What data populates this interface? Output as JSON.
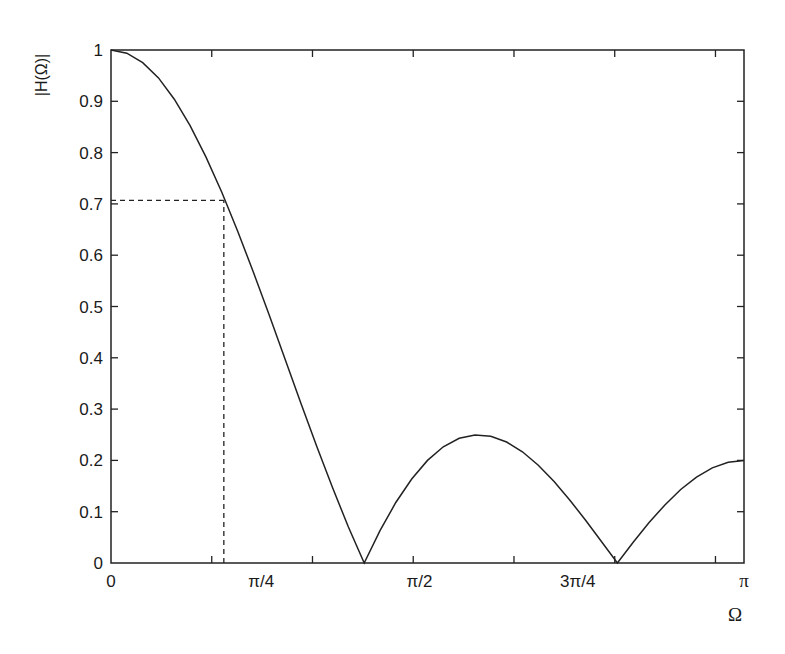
{
  "chart_data": {
    "type": "line",
    "title": "",
    "xlabel": "Ω",
    "ylabel": "|H(Ω)|",
    "xlim": [
      0,
      3.14159
    ],
    "ylim": [
      0,
      1
    ],
    "grid": false,
    "legend": null,
    "x_tick_labels": [
      {
        "value": 0,
        "label": "0"
      },
      {
        "value": 0.7854,
        "label": "π/4"
      },
      {
        "value": 1.5708,
        "label": "π/2"
      },
      {
        "value": 2.3562,
        "label": "3π/4"
      },
      {
        "value": 3.14159,
        "label": "π"
      }
    ],
    "x_minor_ticks": [
      0.5,
      1.0,
      1.5,
      2.0,
      2.5,
      3.0
    ],
    "y_ticks": [
      0,
      0.1,
      0.2,
      0.3,
      0.4,
      0.5,
      0.6,
      0.7,
      0.8,
      0.9,
      1
    ],
    "y_tick_labels": [
      "0",
      "0.1",
      "0.2",
      "0.3",
      "0.4",
      "0.5",
      "0.6",
      "0.7",
      "0.8",
      "0.9",
      "1"
    ],
    "series": [
      {
        "name": "|H(Ω)|",
        "style": "solid",
        "x": [
          0,
          0.0785,
          0.1571,
          0.2356,
          0.3142,
          0.3927,
          0.4712,
          0.5498,
          0.6283,
          0.7069,
          0.7854,
          0.8639,
          0.9425,
          1.021,
          1.0996,
          1.1781,
          1.2566,
          1.3352,
          1.4137,
          1.4923,
          1.5708,
          1.6493,
          1.7279,
          1.8064,
          1.885,
          1.9635,
          2.042,
          2.1206,
          2.1991,
          2.2777,
          2.3562,
          2.4347,
          2.5133,
          2.5918,
          2.6704,
          2.7489,
          2.8274,
          2.906,
          2.9845,
          3.0631,
          3.1416
        ],
        "values": [
          1.0,
          0.9938,
          0.9755,
          0.9457,
          0.904,
          0.8524,
          0.7917,
          0.7228,
          0.6472,
          0.5668,
          0.4828,
          0.3972,
          0.3115,
          0.2274,
          0.1465,
          0.0702,
          0.0,
          0.063,
          0.1179,
          0.1637,
          0.2,
          0.2265,
          0.243,
          0.2498,
          0.2472,
          0.2359,
          0.2167,
          0.1906,
          0.1587,
          0.1224,
          0.0828,
          0.0416,
          0.0,
          0.0405,
          0.0787,
          0.1133,
          0.1432,
          0.1675,
          0.1854,
          0.1963,
          0.2
        ]
      }
    ],
    "annotations": [
      {
        "type": "dashed-hline",
        "y": 0.707,
        "x_from": 0,
        "x_to": 0.56
      },
      {
        "type": "dashed-vline",
        "x": 0.56,
        "y_from": 0,
        "y_to": 0.707
      }
    ]
  },
  "axes": {
    "ylabel": "|H(Ω)|",
    "xlabel": "Ω"
  }
}
